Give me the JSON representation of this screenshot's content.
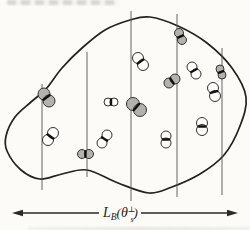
{
  "page": {
    "background": "#fcfbf7"
  },
  "figure": {
    "kind": "blob-with-chords-and-dimers",
    "width_label": {
      "symbol_L": "L",
      "sub_B": "B",
      "paren_open": "(",
      "theta": "θ",
      "sup_perp": "⊥",
      "sub_s": "s",
      "paren_close": ")"
    },
    "colors": {
      "blob_stroke": "#232220",
      "chord_stroke": "#55524e",
      "gray_fill": "#b3b2af",
      "white_fill": "#fdfdfb",
      "circle_stroke": "#34322f",
      "bond_stroke": "#121110",
      "arrow_stroke": "#2b2a28"
    },
    "blob_points": [
      [
        150,
        17
      ],
      [
        178,
        26
      ],
      [
        207,
        43
      ],
      [
        232,
        68
      ],
      [
        246,
        97
      ],
      [
        240,
        126
      ],
      [
        224,
        155
      ],
      [
        200,
        174
      ],
      [
        172,
        187
      ],
      [
        149,
        193
      ],
      [
        118,
        183
      ],
      [
        87,
        170
      ],
      [
        62,
        174
      ],
      [
        40,
        179
      ],
      [
        21,
        170
      ],
      [
        7,
        151
      ],
      [
        6,
        136
      ],
      [
        15,
        117
      ],
      [
        31,
        102
      ],
      [
        46,
        89
      ],
      [
        62,
        68
      ],
      [
        82,
        48
      ],
      [
        105,
        30
      ],
      [
        130,
        20
      ]
    ],
    "vertical_lines": [
      {
        "x": 42,
        "y1": 84,
        "y2": 190
      },
      {
        "x": 87,
        "y1": 52,
        "y2": 177
      },
      {
        "x": 131,
        "y1": 11,
        "y2": 201
      },
      {
        "x": 177,
        "y1": 14,
        "y2": 197
      },
      {
        "x": 222,
        "y1": 48,
        "y2": 195
      }
    ],
    "dimers": [
      {
        "c1": {
          "x": 44,
          "y": 94
        },
        "c2": {
          "x": 49,
          "y": 101
        },
        "r": 6,
        "fill": "gray"
      },
      {
        "c1": {
          "x": 138,
          "y": 58
        },
        "c2": {
          "x": 143,
          "y": 65
        },
        "r": 5.5,
        "fill": "white"
      },
      {
        "c1": {
          "x": 179,
          "y": 33
        },
        "c2": {
          "x": 182,
          "y": 40
        },
        "r": 4.5,
        "fill": "gray"
      },
      {
        "c1": {
          "x": 192,
          "y": 67
        },
        "c2": {
          "x": 196,
          "y": 74
        },
        "r": 5,
        "fill": "white"
      },
      {
        "c1": {
          "x": 220,
          "y": 69
        },
        "c2": {
          "x": 222,
          "y": 75
        },
        "r": 4,
        "fill": "gray"
      },
      {
        "c1": {
          "x": 213,
          "y": 88
        },
        "c2": {
          "x": 215,
          "y": 96
        },
        "r": 5.5,
        "fill": "white"
      },
      {
        "c1": {
          "x": 169,
          "y": 83
        },
        "c2": {
          "x": 175,
          "y": 79
        },
        "r": 5,
        "fill": "gray"
      },
      {
        "c1": {
          "x": 108,
          "y": 102
        },
        "c2": {
          "x": 114,
          "y": 102
        },
        "r": 4,
        "fill": "white"
      },
      {
        "c1": {
          "x": 133,
          "y": 104
        },
        "c2": {
          "x": 140,
          "y": 110
        },
        "r": 6.5,
        "fill": "gray"
      },
      {
        "c1": {
          "x": 48,
          "y": 140
        },
        "c2": {
          "x": 53,
          "y": 133
        },
        "r": 5.5,
        "fill": "white"
      },
      {
        "c1": {
          "x": 102,
          "y": 143
        },
        "c2": {
          "x": 107,
          "y": 135
        },
        "r": 5,
        "fill": "white"
      },
      {
        "c1": {
          "x": 166,
          "y": 136
        },
        "c2": {
          "x": 166,
          "y": 143
        },
        "r": 5,
        "fill": "white"
      },
      {
        "c1": {
          "x": 202,
          "y": 123
        },
        "c2": {
          "x": 202,
          "y": 130
        },
        "r": 5.5,
        "fill": "white"
      },
      {
        "c1": {
          "x": 82,
          "y": 154
        },
        "c2": {
          "x": 89,
          "y": 154
        },
        "r": 4.5,
        "fill": "gray"
      }
    ],
    "arrow": {
      "y": 213,
      "left": {
        "line_from": 99,
        "tip": 12
      },
      "right": {
        "line_from": 141,
        "tip": 238
      }
    },
    "label_anchor": {
      "x": 103,
      "y": 217
    }
  }
}
